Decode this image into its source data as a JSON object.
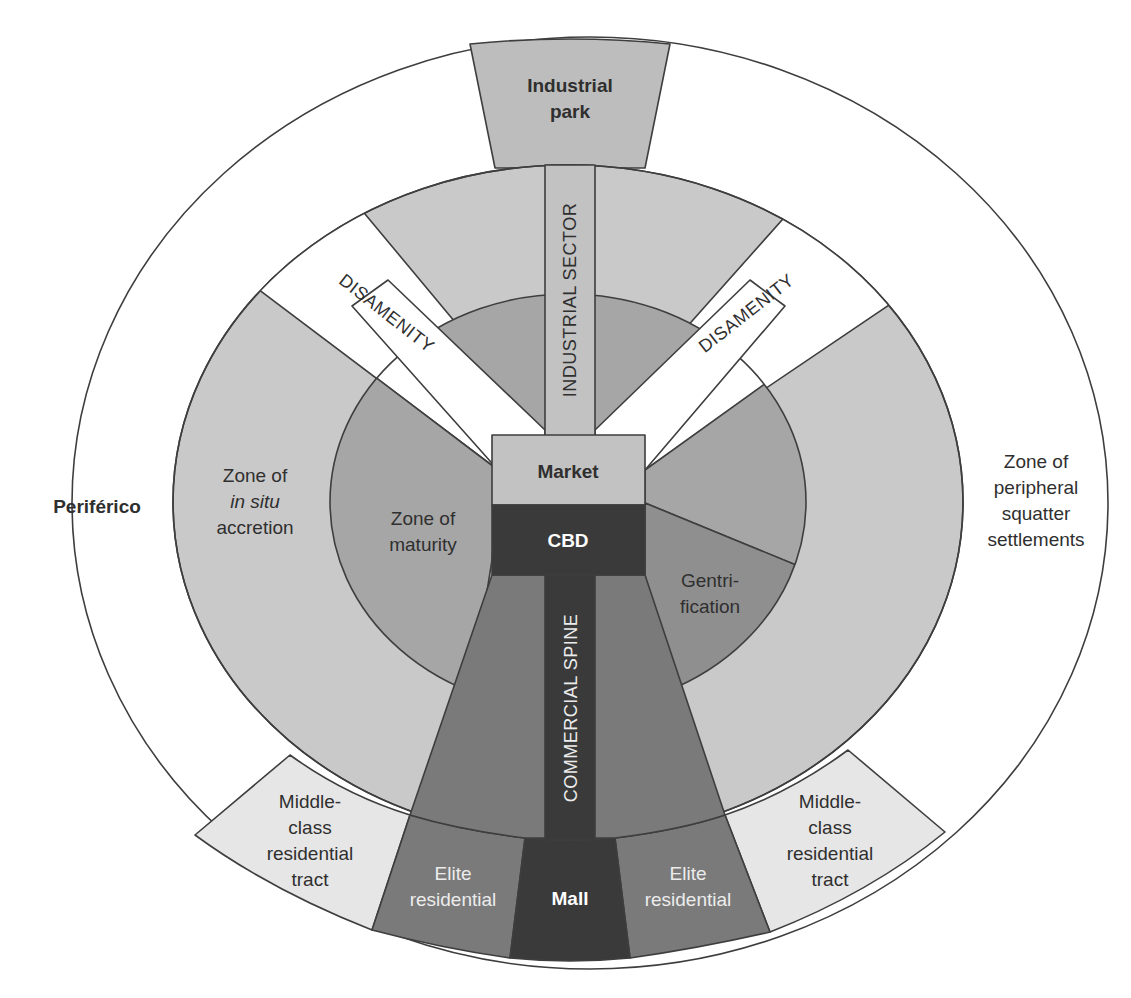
{
  "diagram": {
    "colors": {
      "periferico": "#ffffff",
      "outer_ring": "#c9c9c9",
      "disamenity": "#ffffff",
      "maturity": "#a6a6a6",
      "gentrification": "#8f8f8f",
      "elite": "#7a7a7a",
      "cbd": "#3a3a3a",
      "mall": "#3a3a3a",
      "market": "#c2c2c2",
      "industrial_sector": "#c2c2c2",
      "industrial_park": "#bdbdbd",
      "middle_class": "#e6e6e6"
    },
    "labels": {
      "industrial_park_line1": "Industrial",
      "industrial_park_line2": "park",
      "industrial_sector": "INDUSTRIAL SECTOR",
      "disamenity_left": "DISAMENITY",
      "disamenity_right": "DISAMENITY",
      "market": "Market",
      "cbd": "CBD",
      "commercial_spine": "COMMERCIAL SPINE",
      "periferico": "Periférico",
      "in_situ_line1": "Zone of",
      "in_situ_line2": "in situ",
      "in_situ_line3": "accretion",
      "maturity_line1": "Zone of",
      "maturity_line2": "maturity",
      "gentrification_line1": "Gentri-",
      "gentrification_line2": "fication",
      "squatter_line1": "Zone of",
      "squatter_line2": "peripheral",
      "squatter_line3": "squatter",
      "squatter_line4": "settlements",
      "middle_left_line1": "Middle-",
      "middle_left_line2": "class",
      "middle_left_line3": "residential",
      "middle_left_line4": "tract",
      "middle_right_line1": "Middle-",
      "middle_right_line2": "class",
      "middle_right_line3": "residential",
      "middle_right_line4": "tract",
      "elite_left_line1": "Elite",
      "elite_left_line2": "residential",
      "elite_right_line1": "Elite",
      "elite_right_line2": "residential",
      "mall": "Mall"
    }
  }
}
